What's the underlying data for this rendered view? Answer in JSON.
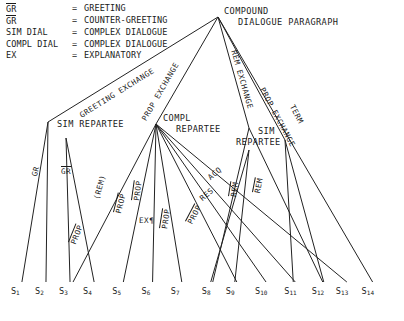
{
  "diagram": {
    "legend": {
      "rows": [
        {
          "symbol": "GR",
          "overline": true,
          "eq": "=",
          "expansion": "GREETING"
        },
        {
          "symbol": "GR",
          "overline": true,
          "eq": "=",
          "expansion": "COUNTER-GREETING"
        },
        {
          "symbol": "SIM DIAL",
          "overline": false,
          "eq": "=",
          "expansion": "COMPLEX DIALOGUE"
        },
        {
          "symbol": "COMPL DIAL",
          "overline": false,
          "eq": "=",
          "expansion": "COMPLEX DIALOGUE"
        },
        {
          "symbol": "EX",
          "overline": false,
          "eq": "=",
          "expansion": "EXPLANATORY"
        }
      ]
    },
    "nodes": {
      "root_line1": "COMPOUND",
      "root_line2": "DIALOGUE PARAGRAPH",
      "sim_repartee_left": "SIM REPARTEE",
      "compl_repartee_line1": "COMPL",
      "compl_repartee_line2": "REPARTEE",
      "sim_repartee_right_line1": "SIM",
      "sim_repartee_right_line2": "REPARTEE"
    },
    "edge_labels": [
      {
        "text": "GREETING EXCHANGE",
        "overline": false
      },
      {
        "text": "PROP EXCHANGE",
        "overline": false
      },
      {
        "text": "REM EXCHANGE",
        "overline": false
      },
      {
        "text": "PROP EXCHANGE",
        "overline": false
      },
      {
        "text": "TERM",
        "overline": false
      },
      {
        "text": "GR",
        "overline": false
      },
      {
        "text": "GR",
        "overline": true
      },
      {
        "text": "PROP",
        "overline": true
      },
      {
        "text": "(REM)",
        "overline": false
      },
      {
        "text": "PROP",
        "overline": true
      },
      {
        "text": "PROP",
        "overline": true
      },
      {
        "text": "EX¶",
        "overline": false
      },
      {
        "text": "PROP",
        "overline": true
      },
      {
        "text": "PROP",
        "overline": true
      },
      {
        "text": "RES",
        "overline": false
      },
      {
        "text": "ACQ",
        "overline": false
      },
      {
        "text": "REM",
        "overline": true
      },
      {
        "text": "REM",
        "overline": true
      }
    ],
    "leaves": [
      {
        "base": "S",
        "sub": "1"
      },
      {
        "base": "S",
        "sub": "2"
      },
      {
        "base": "S",
        "sub": "3"
      },
      {
        "base": "S",
        "sub": "4"
      },
      {
        "base": "S",
        "sub": "5"
      },
      {
        "base": "S",
        "sub": "6"
      },
      {
        "base": "S",
        "sub": "7"
      },
      {
        "base": "S",
        "sub": "8"
      },
      {
        "base": "S",
        "sub": "9"
      },
      {
        "base": "S",
        "sub": "10"
      },
      {
        "base": "S",
        "sub": "11"
      },
      {
        "base": "S",
        "sub": "12"
      },
      {
        "base": "S",
        "sub": "13"
      },
      {
        "base": "S",
        "sub": "14"
      }
    ]
  }
}
